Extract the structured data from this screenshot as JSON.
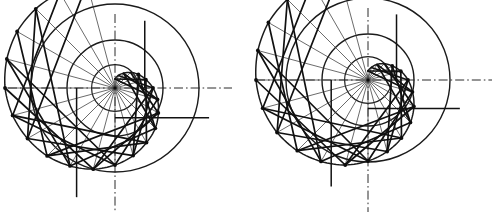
{
  "figure": {
    "kind": "technical-line-drawing",
    "background_color": "#ffffff",
    "line_color": "#111111",
    "centerline_color": "#2a2a2a",
    "radial_color": "#3a3a3a",
    "canvas": {
      "width": 498,
      "height": 220
    }
  },
  "chart_data": {
    "type": "scatter",
    "subtitle": "",
    "xlabel": "",
    "ylabel": "",
    "grid": false,
    "legend": null,
    "annotations": [],
    "diagrams": [
      {
        "name": "left-spiral-diagram",
        "center": {
          "x": 115,
          "y": 88
        },
        "divisions": 24,
        "start_angle_deg": -90,
        "direction": "clockwise",
        "inner_circle_radius": 9,
        "base_circle_radius": 48,
        "outer_circle_radius": 84,
        "spiral": {
          "kind": "archimedean",
          "r_start": 9,
          "r_end": 108,
          "turns": 1.6,
          "theta_start_deg": -90,
          "theta_end_deg": 486
        },
        "horizontal_axis": {
          "x1": 8,
          "x2": 232,
          "y": 88
        },
        "vertical_axis": {
          "x": 115,
          "y1": 14,
          "y2": 212
        },
        "radii_px": [
          9,
          13,
          17,
          22,
          27,
          32,
          38,
          44,
          50,
          57,
          63,
          70,
          77,
          84,
          90,
          96,
          101,
          106,
          110,
          112,
          113,
          112,
          110,
          108
        ],
        "vertex_count": 24
      },
      {
        "name": "right-spiral-diagram",
        "center": {
          "x": 368,
          "y": 80
        },
        "divisions": 24,
        "start_angle_deg": -90,
        "direction": "clockwise",
        "inner_circle_radius": 9,
        "base_circle_radius": 46,
        "outer_circle_radius": 82,
        "spiral": {
          "kind": "archimedean",
          "r_start": 9,
          "r_end": 110,
          "turns": 1.6,
          "theta_start_deg": -90,
          "theta_end_deg": 486
        },
        "horizontal_axis": {
          "x1": 256,
          "x2": 492,
          "y": 80
        },
        "vertical_axis": {
          "x": 368,
          "y1": 8,
          "y2": 212
        },
        "radii_px": [
          9,
          13,
          18,
          23,
          28,
          34,
          40,
          46,
          53,
          60,
          67,
          74,
          81,
          88,
          94,
          100,
          105,
          109,
          112,
          114,
          115,
          114,
          112,
          110
        ],
        "vertex_count": 24
      }
    ]
  }
}
